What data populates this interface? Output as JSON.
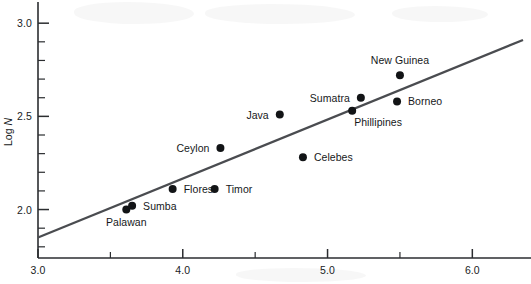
{
  "figure": {
    "background_color": "#ffffff",
    "ink_color": "#16181a",
    "fit_line_color": "#4a4c50",
    "point_color": "#121416"
  },
  "axes": {
    "y_title_prefix": "Log ",
    "y_title_italic": "N",
    "x_ticks_major": [
      "3.0",
      "4.0",
      "5.0",
      "6.0"
    ],
    "y_ticks_major": [
      "2.0",
      "2.5",
      "3.0"
    ]
  },
  "chart_data": {
    "type": "scatter",
    "title": "",
    "subtitle": "",
    "xlabel": "",
    "ylabel": "Log N",
    "xlim": [
      3.0,
      6.35
    ],
    "ylim": [
      1.74,
      3.06
    ],
    "grid": false,
    "legend": "none",
    "x_tick_values": [
      3.0,
      4.0,
      5.0,
      6.0
    ],
    "x_tick_labels": [
      "3.0",
      "4.0",
      "5.0",
      "6.0"
    ],
    "x_minor_tick_values": [
      3.5,
      4.5,
      5.5,
      6.5
    ],
    "y_tick_values": [
      2.0,
      2.5,
      3.0
    ],
    "y_tick_labels": [
      "2.0",
      "2.5",
      "3.0"
    ],
    "y_minor_tick_values": [
      1.8,
      1.9,
      2.1,
      2.2,
      2.3,
      2.4,
      2.6,
      2.7,
      2.8,
      2.9
    ],
    "point_labels_shown": true,
    "points": [
      {
        "label": "Palawan",
        "x": 3.61,
        "y": 2.0,
        "label_pos": "below"
      },
      {
        "label": "Sumba",
        "x": 3.65,
        "y": 2.02,
        "label_pos": "right"
      },
      {
        "label": "Flores",
        "x": 3.93,
        "y": 2.11,
        "label_pos": "right"
      },
      {
        "label": "Timor",
        "x": 4.22,
        "y": 2.11,
        "label_pos": "right"
      },
      {
        "label": "Ceylon",
        "x": 4.26,
        "y": 2.33,
        "label_pos": "left"
      },
      {
        "label": "Java",
        "x": 4.67,
        "y": 2.51,
        "label_pos": "left"
      },
      {
        "label": "Celebes",
        "x": 4.83,
        "y": 2.28,
        "label_pos": "right"
      },
      {
        "label": "Phillipines",
        "x": 5.17,
        "y": 2.53,
        "label_pos": "below-right"
      },
      {
        "label": "Sumatra",
        "x": 5.23,
        "y": 2.6,
        "label_pos": "left"
      },
      {
        "label": "Borneo",
        "x": 5.48,
        "y": 2.58,
        "label_pos": "right"
      },
      {
        "label": "New Guinea",
        "x": 5.5,
        "y": 2.72,
        "label_pos": "above"
      }
    ],
    "fit_line": {
      "type": "linear-regression",
      "x_start": 3.0,
      "y_start": 1.85,
      "x_end": 6.35,
      "y_end": 2.91,
      "slope": 0.316,
      "intercept": 0.902
    }
  }
}
